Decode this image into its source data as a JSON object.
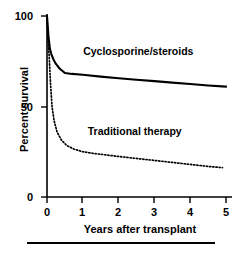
{
  "chart_data": {
    "type": "line",
    "title": "",
    "xlabel": "Years after transplant",
    "ylabel": "Percent survival",
    "xlim": [
      0,
      5
    ],
    "ylim": [
      0,
      100
    ],
    "xticks": [
      "0",
      "1",
      "2",
      "3",
      "4",
      "5"
    ],
    "yticks": [
      "0",
      "50",
      "100"
    ],
    "grid": false,
    "legend": "inline-annotations",
    "series": [
      {
        "name": "Cyclosporine/steroids",
        "style": "solid",
        "color": "#000000",
        "x": [
          0,
          0.04,
          0.08,
          0.12,
          0.18,
          0.25,
          0.35,
          0.5,
          0.7,
          1.0,
          1.5,
          2.0,
          2.5,
          3.0,
          3.5,
          4.0,
          4.5,
          5.0
        ],
        "y": [
          100,
          89,
          82,
          79,
          76,
          73.5,
          71,
          68.5,
          68,
          67.5,
          66.5,
          65.6,
          64.8,
          64,
          63.2,
          62.4,
          61.6,
          61
        ]
      },
      {
        "name": "Traditional therapy",
        "style": "dotted",
        "color": "#000000",
        "x": [
          0,
          0.03,
          0.06,
          0.1,
          0.14,
          0.2,
          0.28,
          0.4,
          0.55,
          0.75,
          1.0,
          1.25,
          1.5,
          2.0,
          2.5,
          3.0,
          3.5,
          4.0,
          4.5,
          4.9
        ],
        "y": [
          100,
          86,
          78,
          62,
          50,
          42,
          36,
          31.5,
          28.5,
          26.5,
          25,
          24.2,
          23.6,
          22.4,
          21.3,
          20.2,
          19.1,
          18.0,
          16.9,
          16.2
        ]
      }
    ],
    "annotations": [
      {
        "text": "Cyclosporine/steroids",
        "x": 2.55,
        "y": 80
      },
      {
        "text": "Traditional therapy",
        "x": 2.45,
        "y": 36
      }
    ]
  },
  "figure": {
    "footer_rule": true
  }
}
